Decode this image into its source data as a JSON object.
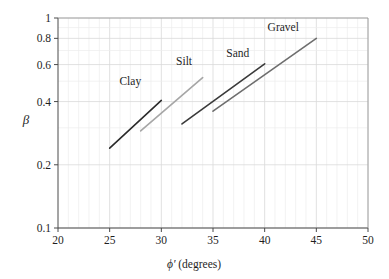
{
  "chart_data": {
    "type": "line",
    "title": "",
    "xlabel": "ϕ′ (degrees)",
    "ylabel": "β",
    "xlim": [
      20,
      50
    ],
    "ylim": [
      0.1,
      1.0
    ],
    "yscale": "log",
    "xscale": "linear",
    "grid": true,
    "legend_position": "inline-annotations",
    "x_ticks": [
      20,
      25,
      30,
      35,
      40,
      45,
      50
    ],
    "x_tick_labels": [
      "20",
      "25",
      "30",
      "35",
      "40",
      "45",
      "50"
    ],
    "x_minor_step": 1,
    "y_ticks": [
      0.1,
      0.2,
      0.4,
      0.6,
      0.8,
      1
    ],
    "y_tick_labels": [
      "0.1",
      "0.2",
      "0.4",
      "0.6",
      "0.8",
      "1"
    ],
    "series": [
      {
        "name": "Clay",
        "color": "#2b2b2b",
        "x": [
          25.0,
          30.0
        ],
        "y": [
          0.24,
          0.405
        ],
        "label_x": 27.0,
        "label_y": 0.5
      },
      {
        "name": "Silt",
        "color": "#a6a6a6",
        "x": [
          28.0,
          34.0
        ],
        "y": [
          0.29,
          0.52
        ],
        "label_x": 32.2,
        "label_y": 0.625
      },
      {
        "name": "Sand",
        "color": "#3a3a3a",
        "x": [
          32.0,
          40.0
        ],
        "y": [
          0.313,
          0.605
        ],
        "label_x": 37.4,
        "label_y": 0.685
      },
      {
        "name": "Gravel",
        "color": "#6e6e6e",
        "x": [
          35.0,
          45.0
        ],
        "y": [
          0.36,
          0.8
        ],
        "label_x": 41.8,
        "label_y": 0.905
      }
    ],
    "annotations": [
      {
        "text": "Clay",
        "for": "Clay"
      },
      {
        "text": "Silt",
        "for": "Silt"
      },
      {
        "text": "Sand",
        "for": "Sand"
      },
      {
        "text": "Gravel",
        "for": "Gravel"
      }
    ],
    "colors": {
      "grid_major": "#d9d9d9",
      "grid_minor": "#ececec",
      "axis": "#4a4a4a",
      "background": "#ffffff"
    }
  }
}
